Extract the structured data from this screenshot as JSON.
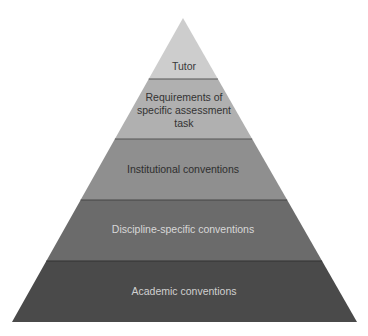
{
  "diagram": {
    "type": "pyramid",
    "levels": [
      {
        "label": "Tutor",
        "lines": [
          "Tutor"
        ],
        "fill": "#cdcdcd",
        "text_color": "#3a3a3a"
      },
      {
        "label": "Requirements of specific assessment task",
        "lines": [
          "Requirements of",
          "specific assessment",
          "task"
        ],
        "fill": "#b0b0b0",
        "text_color": "#333333"
      },
      {
        "label": "Institutional conventions",
        "lines": [
          "Institutional conventions"
        ],
        "fill": "#8f8f8f",
        "text_color": "#2e2e2e"
      },
      {
        "label": "Discipline-specific conventions",
        "lines": [
          "Discipline-specific conventions"
        ],
        "fill": "#6b6b6b",
        "text_color": "#d8d8d8"
      },
      {
        "label": "Academic conventions",
        "lines": [
          "Academic conventions"
        ],
        "fill": "#4a4a4a",
        "text_color": "#d0d0d0"
      }
    ],
    "divider_color": "#3c3c3c"
  }
}
